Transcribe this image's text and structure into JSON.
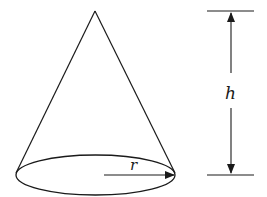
{
  "figure": {
    "labels": {
      "radius": "r",
      "height": "h"
    },
    "colors": {
      "stroke": "#1a1a1a",
      "background": "#ffffff"
    },
    "geometry": {
      "apex": [
        95,
        11
      ],
      "base_ellipse": {
        "cx": 95.5,
        "cy": 175,
        "rx": 79.5,
        "ry": 20
      },
      "radius_arrow": {
        "from": [
          104,
          175
        ],
        "to": [
          174,
          175
        ]
      },
      "height_dimension": {
        "top_line_y": 11,
        "bottom_line_y": 175,
        "line_x_range": [
          207,
          254
        ],
        "arrow_x": 231
      }
    }
  }
}
